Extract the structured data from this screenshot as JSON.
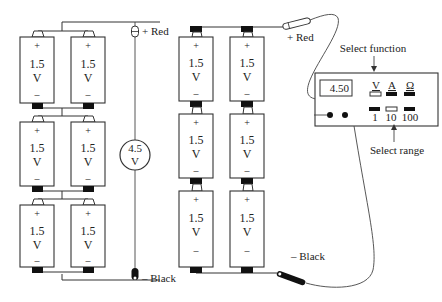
{
  "diagram": {
    "left_circuit": {
      "description": "Three series stages of two parallel 1.5 V cells, measured by a voltmeter",
      "cells": [
        {
          "plus": "+",
          "value": "1.5",
          "unit": "V",
          "minus": "–"
        },
        {
          "plus": "+",
          "value": "1.5",
          "unit": "V",
          "minus": "–"
        },
        {
          "plus": "+",
          "value": "1.5",
          "unit": "V",
          "minus": "–"
        },
        {
          "plus": "+",
          "value": "1.5",
          "unit": "V",
          "minus": "–"
        },
        {
          "plus": "+",
          "value": "1.5",
          "unit": "V",
          "minus": "–"
        },
        {
          "plus": "+",
          "value": "1.5",
          "unit": "V",
          "minus": "–"
        }
      ],
      "voltmeter": {
        "value": "4.5",
        "unit": "V"
      },
      "probe_red_label": "+ Red",
      "probe_black_label": "– Black"
    },
    "right_circuit": {
      "cells": [
        {
          "plus": "+",
          "value": "1.5",
          "unit": "V",
          "minus": "–"
        },
        {
          "plus": "+",
          "value": "1.5",
          "unit": "V",
          "minus": "–"
        },
        {
          "plus": "+",
          "value": "1.5",
          "unit": "V",
          "minus": "–"
        },
        {
          "plus": "+",
          "value": "1.5",
          "unit": "V",
          "minus": "–"
        },
        {
          "plus": "+",
          "value": "1.5",
          "unit": "V",
          "minus": "–"
        },
        {
          "plus": "+",
          "value": "1.5",
          "unit": "V",
          "minus": "–"
        }
      ],
      "probe_red_label": "+ Red",
      "probe_black_label": "– Black"
    },
    "multimeter": {
      "display": "4.50",
      "functions": [
        {
          "label": "V",
          "selected": true
        },
        {
          "label": "A",
          "selected": false
        },
        {
          "label": "Ω",
          "selected": false
        }
      ],
      "ranges": [
        {
          "label": "1",
          "selected": false
        },
        {
          "label": "10",
          "selected": true
        },
        {
          "label": "100",
          "selected": false
        }
      ],
      "select_function_label": "Select function",
      "select_range_label": "Select range"
    }
  }
}
